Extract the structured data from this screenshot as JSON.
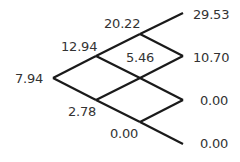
{
  "tree": {
    "type": "binomial-tree",
    "steps": 3,
    "line_color": "#1a1a1a",
    "nodes": {
      "n0": {
        "label": "7.94",
        "x": 53,
        "y": 78
      },
      "n1u": {
        "label": "12.94",
        "x": 96,
        "y": 56
      },
      "n1d": {
        "label": "2.78",
        "x": 96,
        "y": 100
      },
      "n2uu": {
        "label": "20.22",
        "x": 140,
        "y": 34
      },
      "n2ud": {
        "label": "5.46",
        "x": 140,
        "y": 78
      },
      "n2dd": {
        "label": "0.00",
        "x": 140,
        "y": 122
      },
      "n3uuu": {
        "label": "29.53",
        "x": 183,
        "y": 13
      },
      "n3uud": {
        "label": "10.70",
        "x": 183,
        "y": 56
      },
      "n3udd": {
        "label": "0.00",
        "x": 183,
        "y": 100
      },
      "n3ddd": {
        "label": "0.00",
        "x": 183,
        "y": 144
      }
    }
  }
}
